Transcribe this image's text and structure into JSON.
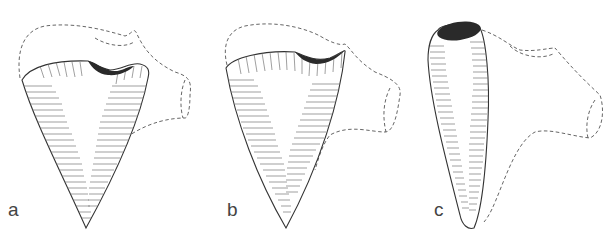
{
  "figure": {
    "panels": [
      {
        "id": "a",
        "label": "a",
        "label_pos": [
          8,
          200
        ]
      },
      {
        "id": "b",
        "label": "b",
        "label_pos": [
          227,
          200
        ]
      },
      {
        "id": "c",
        "label": "c",
        "label_pos": [
          434,
          200
        ]
      }
    ],
    "colors": {
      "background": "#ffffff",
      "outline": "#333333",
      "dashed": "#555555",
      "hatch": "#777777",
      "cavity": "#2a2a2a"
    }
  }
}
